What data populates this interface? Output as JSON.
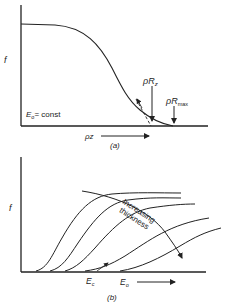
{
  "panel_a": {
    "y_label": "f",
    "x_label": "ρz",
    "condition_label": "E",
    "condition_sub": "o",
    "condition_rest": "= const",
    "marker1_main": "ρR",
    "marker1_sub": "z",
    "marker2_main": "ρR",
    "marker2_sub": "max",
    "caption": "(a)"
  },
  "panel_b": {
    "y_label": "f",
    "x_marker_main": "E",
    "x_marker_sub": "c",
    "x_label_main": "E",
    "x_label_sub": "o",
    "annotation_line1": "Increasing",
    "annotation_line2": "thickness",
    "caption": "(b)",
    "curve_count": 5
  },
  "colors": {
    "ink": "#222222",
    "background": "#ffffff"
  }
}
